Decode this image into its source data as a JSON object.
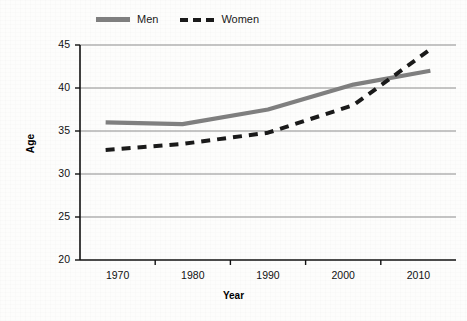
{
  "chart_data": {
    "type": "line",
    "title": "",
    "xlabel": "Year",
    "ylabel": "Age",
    "x": [
      1971,
      1980,
      1990,
      2000,
      2009
    ],
    "categories": [
      "1970",
      "1980",
      "1990",
      "2000",
      "2010"
    ],
    "series": [
      {
        "name": "Men",
        "style": "solid",
        "color": "#7f7f7f",
        "values": [
          36.0,
          35.8,
          37.5,
          40.4,
          42.0
        ]
      },
      {
        "name": "Women",
        "style": "dashed",
        "color": "#1a1a1a",
        "values": [
          32.8,
          33.5,
          34.8,
          38.0,
          44.5
        ]
      }
    ],
    "xlim": [
      1968,
      2012
    ],
    "ylim": [
      20,
      45
    ],
    "ytick_values": [
      20,
      25,
      30,
      35,
      40,
      45
    ],
    "ytick_labels": [
      "20",
      "25",
      "30",
      "35",
      "40",
      "45"
    ],
    "xtick_labels": [
      "1970",
      "1980",
      "1990",
      "2000",
      "2010"
    ],
    "grid": "horizontal",
    "legend_position": "top-left",
    "annotations": []
  },
  "legend": {
    "men_label": "Men",
    "women_label": "Women"
  },
  "axes": {
    "y_title": "Age",
    "x_title": "Year"
  },
  "colors": {
    "men_line": "#7f7f7f",
    "women_line": "#1a1a1a",
    "grid": "#8c8c8c",
    "axis": "#111111",
    "background": "#fdfdfc"
  }
}
